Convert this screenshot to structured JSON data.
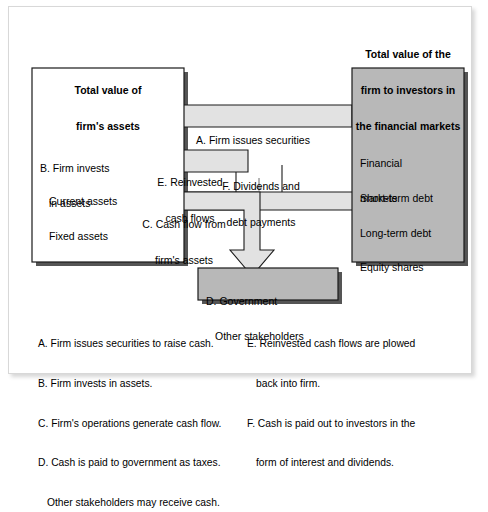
{
  "figure": {
    "title_left": "Total value of\nfirm's assets",
    "title_right": "Total value of the\nfirm to investors in\nthe financial markets"
  },
  "colors": {
    "gray_fill": "#b8b8b8",
    "arrow_fill": "#e2e2e2",
    "white_fill": "#ffffff",
    "stroke": "#1a1a1a",
    "page_bg": "#ffffff",
    "shadow": "#4a4a4a"
  },
  "boxes": {
    "assets": {
      "name": "Total value of firm's assets",
      "line1": "B. Firm invests",
      "line2": "in assets",
      "line3": "Current assets",
      "line4": "Fixed assets"
    },
    "markets": {
      "name": "Total value of the firm to investors in the financial markets",
      "line1": "Financial",
      "line2": "markets",
      "line3": "Short-term debt",
      "line4": "Long-term debt",
      "line5": "Equity shares"
    },
    "government": {
      "line1": "D. Government",
      "line2": "Other stakeholders"
    }
  },
  "arrows": {
    "a": {
      "id": "A",
      "label": "A. Firm issues securities",
      "direction": "left"
    },
    "e": {
      "id": "E",
      "label": "E. Reinvested\ncash flows",
      "line1": "E. Reinvested",
      "line2": "cash flows",
      "direction": "left"
    },
    "c": {
      "id": "C",
      "label": "C. Cash flow from\nfirm's assets",
      "line1": "C. Cash flow from",
      "line2": "firm's assets",
      "direction": "right-down"
    },
    "f": {
      "id": "F",
      "label": "F. Dividends and\ndebt payments",
      "line1": "F. Dividends and",
      "line2": "debt payments",
      "direction": "right"
    }
  },
  "legend": {
    "left": [
      {
        "key": "A.",
        "text": "Firm issues securities to raise cash."
      },
      {
        "key": "B.",
        "text": "Firm invests in assets."
      },
      {
        "key": "C.",
        "text": "Firm's operations generate cash flow."
      },
      {
        "key": "D.",
        "text": "Cash is paid to government as taxes."
      },
      {
        "key": "",
        "text": "Other stakeholders may receive cash."
      }
    ],
    "right": [
      {
        "key": "E.",
        "text": "Reinvested cash flows are plowed"
      },
      {
        "key": "",
        "text": "back into firm."
      },
      {
        "key": "F.",
        "text": "Cash is paid out to investors in the"
      },
      {
        "key": "",
        "text": "form of interest and dividends."
      }
    ],
    "left_lines": [
      "A. Firm issues securities to raise cash.",
      "B. Firm invests in assets.",
      "C. Firm's operations generate cash flow.",
      "D. Cash is paid to government as taxes.",
      "Other stakeholders may receive cash."
    ],
    "right_lines": [
      "E. Reinvested cash flows are plowed",
      "back into firm.",
      "F. Cash is paid out to investors in the",
      "form of interest and dividends."
    ]
  }
}
